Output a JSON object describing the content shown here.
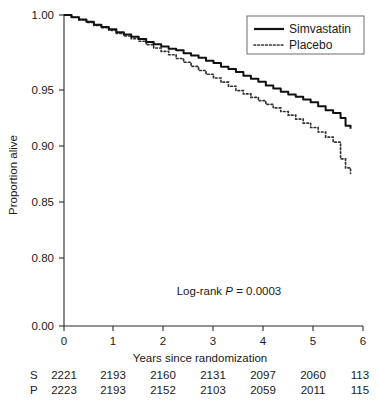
{
  "chart_data": {
    "type": "line",
    "title": "",
    "subtitle": "",
    "xlabel": "Years since randomization",
    "ylabel": "Proportion alive",
    "xlim": [
      0,
      6
    ],
    "ylim": [
      0.78,
      1.0
    ],
    "grid": false,
    "legend_position": "top-right",
    "y_axis_break": true,
    "y_ticks": [
      "1.00",
      "0.95",
      "0.90",
      "0.85",
      "0.80",
      "0.00"
    ],
    "y_tick_values": [
      1.0,
      0.95,
      0.9,
      0.85,
      0.8,
      0.0
    ],
    "x_ticks": [
      "0",
      "1",
      "2",
      "3",
      "4",
      "5",
      "6"
    ],
    "x_tick_values": [
      0,
      1,
      2,
      3,
      4,
      5,
      6
    ],
    "annotation": {
      "prefix": "Log-rank ",
      "statistic": "P",
      "suffix": " = 0.0003"
    },
    "series": [
      {
        "name": "Simvastatin",
        "style": "solid",
        "color": "#111111",
        "x": [
          0.0,
          0.15,
          0.3,
          0.45,
          0.6,
          0.75,
          0.9,
          1.05,
          1.2,
          1.35,
          1.5,
          1.65,
          1.8,
          1.95,
          2.1,
          2.25,
          2.4,
          2.55,
          2.7,
          2.85,
          3.0,
          3.15,
          3.3,
          3.45,
          3.6,
          3.75,
          3.9,
          4.05,
          4.2,
          4.35,
          4.5,
          4.65,
          4.8,
          4.95,
          5.1,
          5.25,
          5.4,
          5.55,
          5.65,
          5.75
        ],
        "y": [
          1.0,
          0.9985,
          0.997,
          0.9955,
          0.9935,
          0.992,
          0.9905,
          0.9885,
          0.987,
          0.9855,
          0.984,
          0.982,
          0.9805,
          0.979,
          0.9775,
          0.9765,
          0.9745,
          0.973,
          0.9715,
          0.9695,
          0.968,
          0.9655,
          0.964,
          0.962,
          0.9595,
          0.9575,
          0.9555,
          0.953,
          0.951,
          0.9485,
          0.946,
          0.944,
          0.9415,
          0.939,
          0.9355,
          0.932,
          0.9295,
          0.925,
          0.918,
          0.9155
        ]
      },
      {
        "name": "Placebo",
        "style": "dotted",
        "color": "#333333",
        "x": [
          0.0,
          0.15,
          0.3,
          0.45,
          0.6,
          0.75,
          0.9,
          1.05,
          1.2,
          1.35,
          1.5,
          1.65,
          1.8,
          1.95,
          2.1,
          2.25,
          2.4,
          2.55,
          2.7,
          2.85,
          3.0,
          3.15,
          3.3,
          3.45,
          3.6,
          3.75,
          3.9,
          4.05,
          4.2,
          4.35,
          4.5,
          4.65,
          4.8,
          4.95,
          5.1,
          5.25,
          5.4,
          5.55,
          5.65,
          5.75
        ],
        "y": [
          1.0,
          0.9985,
          0.9968,
          0.995,
          0.993,
          0.9915,
          0.9898,
          0.9878,
          0.986,
          0.9842,
          0.9825,
          0.9802,
          0.978,
          0.9758,
          0.9735,
          0.971,
          0.9685,
          0.9658,
          0.963,
          0.9605,
          0.958,
          0.9552,
          0.9525,
          0.9495,
          0.9465,
          0.9435,
          0.9405,
          0.9372,
          0.934,
          0.9308,
          0.9275,
          0.924,
          0.9205,
          0.9165,
          0.9125,
          0.908,
          0.9035,
          0.8885,
          0.8805,
          0.8755
        ]
      }
    ],
    "risk_table": {
      "columns": [
        "0",
        "1",
        "2",
        "3",
        "4",
        "5",
        "6"
      ],
      "rows": [
        {
          "key": "S",
          "values": [
            "2221",
            "2193",
            "2160",
            "2131",
            "2097",
            "2060",
            "113"
          ]
        },
        {
          "key": "P",
          "values": [
            "2223",
            "2193",
            "2152",
            "2103",
            "2059",
            "2011",
            "115"
          ]
        }
      ]
    }
  }
}
